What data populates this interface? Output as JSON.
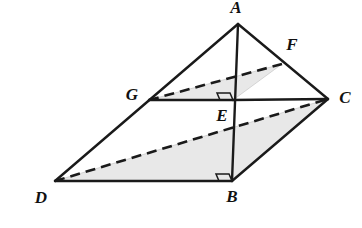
{
  "figure": {
    "type": "geometric-diagram",
    "background_color": "#ffffff",
    "stroke_color": "#1a1a1a",
    "shade_color": "#e8e8e8",
    "shade_stroke": "#bfbfbf",
    "canvas": {
      "width": 362,
      "height": 228
    }
  },
  "points": {
    "A": {
      "label": "A",
      "x": 238,
      "y": 24,
      "label_x": 236,
      "label_y": 13
    },
    "B": {
      "label": "B",
      "x": 232,
      "y": 181,
      "label_x": 232,
      "label_y": 202
    },
    "C": {
      "label": "C",
      "x": 328,
      "y": 99,
      "label_x": 345,
      "label_y": 103
    },
    "D": {
      "label": "D",
      "x": 55,
      "y": 181,
      "label_x": 41,
      "label_y": 203
    },
    "E": {
      "label": "E",
      "x": 233,
      "y": 100,
      "label_x": 222,
      "label_y": 121
    },
    "F": {
      "label": "F",
      "x": 282,
      "y": 64,
      "label_x": 292,
      "label_y": 50
    },
    "G": {
      "label": "G",
      "x": 149,
      "y": 100,
      "label_x": 132,
      "label_y": 100
    }
  },
  "shaded_regions": [
    {
      "name": "base-quadrilateral-DBC",
      "vertices": "D,B,C"
    },
    {
      "name": "cross-section-GEF",
      "vertices": "G,E,F"
    }
  ],
  "solid_edges": [
    {
      "name": "edge-A-D",
      "from": "A",
      "to": "D"
    },
    {
      "name": "edge-A-B",
      "from": "A",
      "to": "B"
    },
    {
      "name": "edge-A-C",
      "from": "A",
      "to": "C"
    },
    {
      "name": "edge-D-B",
      "from": "D",
      "to": "B"
    },
    {
      "name": "edge-B-C",
      "from": "B",
      "to": "C"
    },
    {
      "name": "edge-G-E",
      "from": "G",
      "to": "E"
    },
    {
      "name": "edge-E-C",
      "from": "E",
      "to": "C"
    }
  ],
  "dashed_edges": [
    {
      "name": "edge-D-C",
      "from": "D",
      "to": "C"
    },
    {
      "name": "edge-G-F",
      "from": "G",
      "to": "F"
    }
  ],
  "right_angle_marks": [
    {
      "name": "right-angle-at-B",
      "at": "B"
    },
    {
      "name": "right-angle-at-E",
      "at": "E"
    }
  ]
}
